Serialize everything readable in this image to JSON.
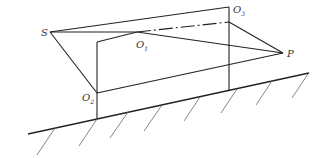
{
  "diagram": {
    "type": "geometry",
    "labels": {
      "S": {
        "main": "S",
        "sub": ""
      },
      "O1": {
        "main": "O",
        "sub": "1"
      },
      "O2": {
        "main": "O",
        "sub": "2"
      },
      "O3": {
        "main": "O",
        "sub": "3"
      },
      "P": {
        "main": "P",
        "sub": ""
      }
    },
    "colors": {
      "line": "#222222",
      "hatch": "#666666"
    }
  }
}
